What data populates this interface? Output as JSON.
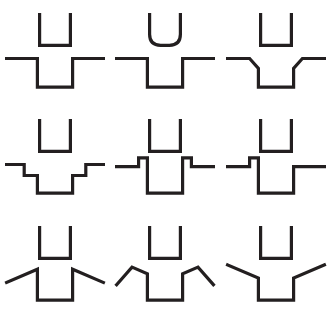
{
  "page": {
    "background_color": "#ffffff",
    "stroke_color": "#231f20",
    "stroke_width": 3.2,
    "width": 331,
    "height": 319,
    "grid_rows": 3,
    "grid_columns": 3
  },
  "figures": [
    {
      "id": "r1c1",
      "row": 1,
      "column": 1,
      "name": "square-u-over-square-notch",
      "top_shape": "square-bottom U (open top), straight vertical walls, flat base, sharp right-angle corners",
      "bottom_shape": "horizontal baseline with a rectangular square-cornered notch dropping straight down in the center",
      "top_path": "M 36 10 L 36 38 L 64 38 L 64 10",
      "bottom_path": "M 6 50 L 34 50 L 34 76 L 66 76 L 66 50 L 94 50"
    },
    {
      "id": "r1c2",
      "row": 1,
      "column": 2,
      "name": "rounded-u-over-square-notch",
      "top_shape": "U with rounded (curved) bottom corners, straight vertical walls",
      "bottom_shape": "horizontal baseline with a rectangular square-cornered notch dropping straight down in the center",
      "top_path": "M 36 10 L 36 28 Q 36 38 46 38 L 54 38 Q 64 38 64 28 L 64 10",
      "bottom_path": "M 6 50 L 34 50 L 34 76 L 66 76 L 66 50 L 94 50"
    },
    {
      "id": "r1c3",
      "row": 1,
      "column": 3,
      "name": "square-u-over-chamfered-notch",
      "top_shape": "square-bottom U (open top), straight vertical walls, flat base, sharp right-angle corners",
      "bottom_shape": "horizontal baseline with a notch whose upper corners are chamfered at 45 degrees before the vertical walls drop",
      "top_path": "M 36 10 L 36 38 L 64 38 L 64 10",
      "bottom_path": "M 6 50 L 26 50 L 34 59 L 34 76 L 66 76 L 66 59 L 74 50 L 94 50"
    },
    {
      "id": "r2c1",
      "row": 2,
      "column": 1,
      "name": "square-u-over-stepped-notch",
      "top_shape": "square-bottom U (open top), straight vertical walls, flat base, sharp right-angle corners",
      "bottom_shape": "horizontal baseline descending into the notch by two square staircase steps on each side",
      "top_path": "M 36 10 L 36 38 L 64 38 L 64 10",
      "bottom_path": "M 6 50 L 22 50 L 22 60 L 34 60 L 34 76 L 66 76 L 66 60 L 78 60 L 78 50 L 94 50"
    },
    {
      "id": "r2c2",
      "row": 2,
      "column": 2,
      "name": "square-u-over-bumped-notch-symmetric",
      "top_shape": "square-bottom U (open top), straight vertical walls, flat base, sharp right-angle corners",
      "bottom_shape": "horizontal baseline with a small upward tab/bump on each side immediately before the notch walls drop down",
      "top_path": "M 36 10 L 36 38 L 64 38 L 64 10",
      "bottom_path": "M 6 52 L 26 52 L 26 44 L 34 44 L 34 76 L 66 76 L 66 44 L 74 44 L 74 52 L 94 52"
    },
    {
      "id": "r2c3",
      "row": 2,
      "column": 3,
      "name": "square-u-over-bumped-notch-asymmetric",
      "top_shape": "square-bottom U (open top), straight vertical walls, flat base, sharp right-angle corners",
      "bottom_shape": "horizontal baseline with a small upward tab/bump only on the left side before the notch; the right wall rises straight back to the baseline",
      "top_path": "M 36 10 L 36 38 L 64 38 L 64 10",
      "bottom_path": "M 6 52 L 26 52 L 26 44 L 34 44 L 34 76 L 66 76 L 66 52 L 94 52"
    },
    {
      "id": "r3c1",
      "row": 3,
      "column": 1,
      "name": "square-u-over-downward-diagonal-notch",
      "top_shape": "square-bottom U (open top), straight vertical walls, flat base, sharp right-angle corners",
      "bottom_shape": "notch whose vertical walls are joined by long diagonals sloping downward and outward to the left and right",
      "top_path": "M 36 10 L 36 38 L 64 38 L 64 10",
      "bottom_path": "M 6 60 L 34 48 L 34 76 L 66 76 L 66 48 L 94 60"
    },
    {
      "id": "r3c2",
      "row": 3,
      "column": 2,
      "name": "square-u-over-peaked-diagonal-notch",
      "top_shape": "square-bottom U (open top), straight vertical walls, flat base, sharp right-angle corners",
      "bottom_shape": "notch with inverted-V peaks on each side: diagonals rise from the notch walls to a peak then fall outward and downward",
      "top_path": "M 36 10 L 36 38 L 64 38 L 64 10",
      "bottom_path": "M 6 62 L 20 46 L 34 52 L 34 76 L 66 76 L 66 52 L 80 46 L 94 62"
    },
    {
      "id": "r3c3",
      "row": 3,
      "column": 3,
      "name": "square-u-over-upward-diagonal-notch",
      "top_shape": "square-bottom U (open top), straight vertical walls, flat base, sharp right-angle corners",
      "bottom_shape": "notch whose vertical walls are joined by long diagonals sloping upward and outward to the left and right, forming a wide Y",
      "top_path": "M 36 10 L 36 38 L 64 38 L 64 10",
      "bottom_path": "M 6 44 L 34 56 L 34 76 L 66 76 L 66 56 L 94 44"
    }
  ]
}
